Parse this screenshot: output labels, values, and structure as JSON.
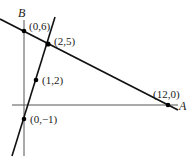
{
  "diagram": {
    "type": "coordinate-geometry",
    "axes": {
      "x_axis_label": "A",
      "y_axis_label": "B"
    },
    "points": [
      {
        "label": "(0,6)",
        "x": 0,
        "y": 6
      },
      {
        "label": "(2,5)",
        "x": 2,
        "y": 5
      },
      {
        "label": "(1,2)",
        "x": 1,
        "y": 2
      },
      {
        "label": "(0,−1)",
        "x": 0,
        "y": -1
      },
      {
        "label": "(12,0)",
        "x": 12,
        "y": 0
      }
    ],
    "lines": [
      {
        "name": "line-through-0-6-and-12-0",
        "through": [
          "(0,6)",
          "(12,0)"
        ]
      },
      {
        "name": "line-through-0-neg1-and-2-5",
        "through": [
          "(0,−1)",
          "(1,2)",
          "(2,5)"
        ]
      }
    ],
    "colors": {
      "line": "#111111",
      "axis": "#555555",
      "point": "#000000"
    }
  }
}
